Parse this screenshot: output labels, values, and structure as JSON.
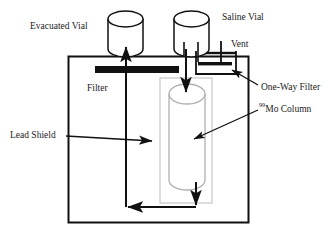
{
  "figure": {
    "background_color": "#ffffff",
    "stroke_color": "#111111",
    "column_stroke_color": "#b8b8b8",
    "shield_stroke_color": "#111111"
  },
  "labels": {
    "evacuated_vial": "Evacuated Vial",
    "saline_vial": "Saline Vial",
    "vent": "Vent",
    "filter": "Filter",
    "one_way_filter": "One-Way Filter",
    "mo_column_sup": "99",
    "mo_column": "Mo Column",
    "lead_shield": "Lead Shield"
  },
  "components": {
    "lead_shield_box": {
      "x": 68,
      "y": 56,
      "width": 180,
      "height": 166
    },
    "evacuated_vial": {
      "x": 107,
      "y": 12,
      "width": 36,
      "height": 44
    },
    "saline_vial": {
      "x": 173,
      "y": 12,
      "width": 36,
      "height": 44
    },
    "filter_bar": {
      "x": 95,
      "y": 66,
      "width": 84,
      "height": 7
    },
    "one_way_filter_box": {
      "x": 196,
      "y": 51,
      "width": 40,
      "height": 23
    },
    "mo_column_outer": {
      "x": 160,
      "y": 78,
      "width": 52,
      "height": 125
    },
    "mo_column_cylinder": {
      "x": 169,
      "y": 86,
      "width": 36,
      "height": 108
    }
  }
}
